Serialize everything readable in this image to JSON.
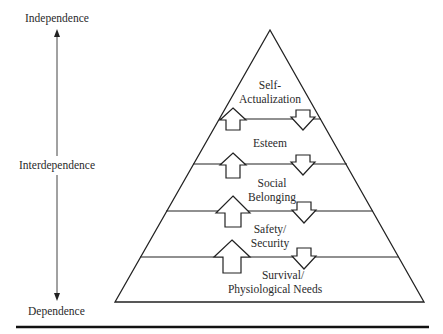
{
  "axis": {
    "top_label": "Independence",
    "middle_label": "Interdependence",
    "bottom_label": "Dependence"
  },
  "pyramid": {
    "levels": [
      {
        "line1": "Self-",
        "line2": "Actualization"
      },
      {
        "line1": "Esteem",
        "line2": ""
      },
      {
        "line1": "Social",
        "line2": "Belonging"
      },
      {
        "line1": "Safety/",
        "line2": "Security"
      },
      {
        "line1": "Survival/",
        "line2": "Physiological Needs"
      }
    ]
  },
  "colors": {
    "stroke": "#222222",
    "background": "#ffffff"
  }
}
